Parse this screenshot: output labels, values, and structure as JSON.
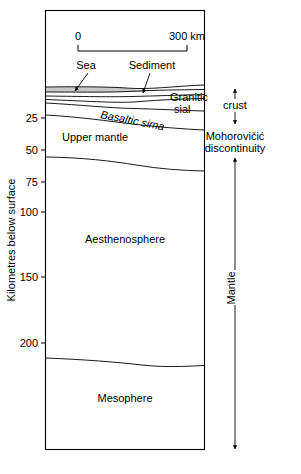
{
  "figure": {
    "type": "geological-cross-section",
    "axis": {
      "title": "Kilometres below surface",
      "ticks": [
        {
          "label": "25",
          "depth_km": 25
        },
        {
          "label": "50",
          "depth_km": 50
        },
        {
          "label": "75",
          "depth_km": 75
        },
        {
          "label": "100",
          "depth_km": 100
        },
        {
          "label": "150",
          "depth_km": 150
        },
        {
          "label": "200",
          "depth_km": 200
        }
      ]
    },
    "scale_bar": {
      "start_label": "0",
      "end_label": "300 km",
      "length_km": 300
    },
    "layers": [
      {
        "name": "Sea",
        "kind": "callout"
      },
      {
        "name": "Sediment",
        "kind": "callout"
      },
      {
        "name": "Granitic sial",
        "line1": "Granitic",
        "line2": "sial",
        "kind": "layer-label"
      },
      {
        "name": "Basaltic sima",
        "kind": "layer-label-italic"
      },
      {
        "name": "Upper mantle",
        "kind": "region"
      },
      {
        "name": "Aesthenosphere",
        "kind": "region"
      },
      {
        "name": "Mesophere",
        "kind": "region"
      }
    ],
    "brackets": [
      {
        "label": "crust",
        "orientation": "vertical",
        "span": "surface-to-moho"
      },
      {
        "label": "Mantle",
        "orientation": "vertical-rotated",
        "span": "moho-to-base"
      }
    ],
    "annotations": [
      {
        "line1": "Mohorovičić",
        "line2": "discontinuity",
        "name": "moho-annotation"
      }
    ]
  }
}
